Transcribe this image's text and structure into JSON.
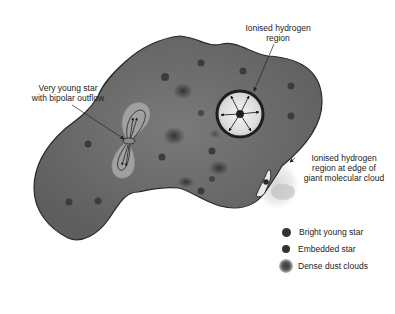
{
  "diagram": {
    "labels": {
      "bipolar": [
        "Very young star",
        "with bipolar outflow"
      ],
      "hii_region": [
        "Ionised hydrogen",
        "region"
      ],
      "edge_hii": [
        "Ionised hydrogen",
        "region at edge of",
        "giant molecular cloud"
      ]
    },
    "legend": [
      {
        "label": "Bright young star",
        "symbol": "dark-dot"
      },
      {
        "label": "Embedded star",
        "symbol": "dark-dot-small"
      },
      {
        "label": "Dense dust clouds",
        "symbol": "dark-blur"
      }
    ],
    "colors": {
      "cloud_fill": "#6e6e6e",
      "cloud_outline": "#2a2a2a",
      "star": "#3c3c3c",
      "hii_fill": "#e8e8e8",
      "outflow_fill": "#9a9a9a",
      "background": "#ffffff"
    }
  }
}
